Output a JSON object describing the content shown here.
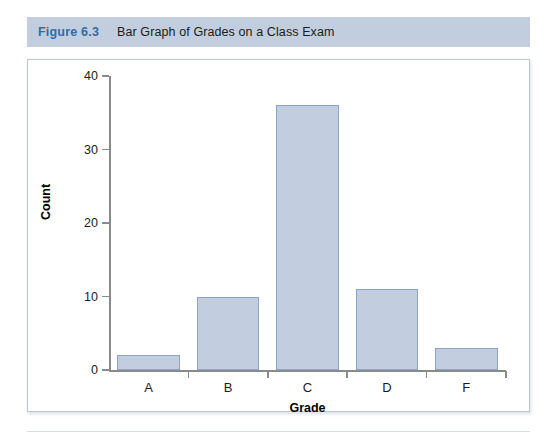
{
  "caption": {
    "figure_number": "Figure 6.3",
    "title": "Bar Graph of Grades on a Class Exam"
  },
  "colors": {
    "caption_band": "#c2cedd",
    "figure_number_text": "#2f6ca8",
    "bar_fill": "#c3cde0",
    "bar_stroke": "#8fa3c4",
    "axis": "#8a8a8a",
    "frame_border": "#b9c7d8"
  },
  "chart_data": {
    "type": "bar",
    "title": "Bar Graph of Grades on a Class Exam",
    "categories": [
      "A",
      "B",
      "C",
      "D",
      "F"
    ],
    "values": [
      2,
      10,
      36,
      11,
      3
    ],
    "xlabel": "Grade",
    "ylabel": "Count",
    "ylim": [
      0,
      40
    ],
    "yticks": [
      0,
      10,
      20,
      30,
      40
    ],
    "ytick_labels": [
      "0",
      "10",
      "20",
      "30",
      "40"
    ],
    "grid": false,
    "legend": false
  }
}
